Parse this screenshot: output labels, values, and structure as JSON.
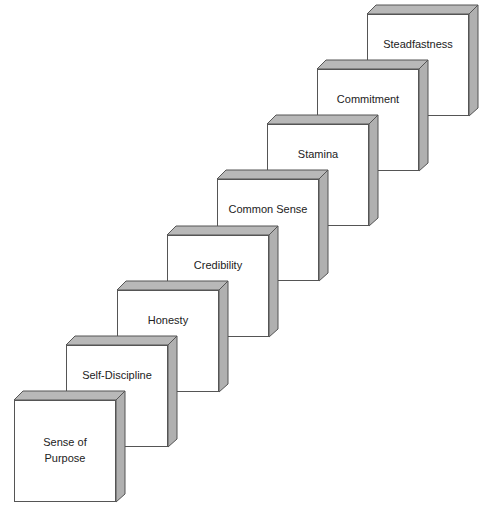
{
  "diagram": {
    "type": "staircase-blocks",
    "colors": {
      "face": "#ffffff",
      "bevel": "#b8b8b8",
      "edge": "#555555"
    },
    "steps": [
      {
        "label": "Sense of Purpose",
        "line1": "Sense of",
        "line2": "Purpose"
      },
      {
        "label": "Self-Discipline"
      },
      {
        "label": "Honesty"
      },
      {
        "label": "Credibility"
      },
      {
        "label": "Common Sense"
      },
      {
        "label": "Stamina"
      },
      {
        "label": "Commitment"
      },
      {
        "label": "Steadfastness"
      }
    ]
  }
}
